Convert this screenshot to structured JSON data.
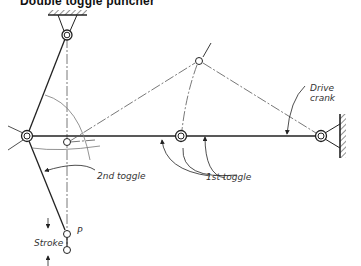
{
  "title": "Double toggle puncher",
  "labels": {
    "drive_crank_line1": "Drive",
    "drive_crank_line2": "crank",
    "first_toggle": "1st toggle",
    "second_toggle": "2nd toggle",
    "stroke": "Stroke",
    "punch_point": "P"
  },
  "colors": {
    "line": "#222222",
    "centerline": "#555555",
    "background": "#ffffff"
  },
  "geometry": {
    "top_fixed_pivot": [
      67,
      35
    ],
    "left_pivot": [
      27,
      136
    ],
    "middle_pivot": [
      181,
      136
    ],
    "right_fixed_pivot": [
      321,
      136
    ],
    "crank_pin_alt": [
      199,
      61
    ],
    "left_pivot_alt": [
      67,
      142
    ],
    "punch_P": [
      67,
      234
    ],
    "punch_bottom": [
      67,
      250
    ]
  }
}
